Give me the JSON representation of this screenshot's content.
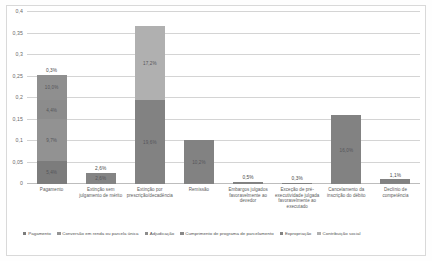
{
  "chart_data": {
    "type": "bar",
    "subtype": "stacked-bar",
    "title": "",
    "xlabel": "",
    "ylabel": "",
    "ylim": [
      0,
      0.4
    ],
    "grid": true,
    "legend_position": "bottom",
    "y_ticks": [
      0,
      0.05,
      0.1,
      0.15,
      0.2,
      0.25,
      0.3,
      0.35,
      0.4
    ],
    "y_tick_labels": [
      "0",
      "0,05",
      "0,1",
      "0,15",
      "0,2",
      "0,25",
      "0,3",
      "0,35",
      "0,4"
    ],
    "categories": [
      "Pagamento",
      "Extinção sem julgamento de mérito",
      "Extinção por prescrição/decadência",
      "Remissão",
      "Embargos julgados favoravelmente ao devedor",
      "Exceção de pré-executividade julgada favoravelmente ao executado",
      "Cancelamento da inscrição do débito",
      "Declínio de competência"
    ],
    "series": [
      {
        "name": "Pagamento",
        "color": "#7f7f7f",
        "values": [
          0.054,
          0.0,
          0.0,
          0.0,
          0.0,
          0.0,
          0.0,
          0.0
        ]
      },
      {
        "name": "Conversão em renda ou parcela única",
        "color": "#9a9a9a",
        "values": [
          0.047,
          0.0,
          0.0,
          0.0,
          0.0,
          0.0,
          0.0,
          0.0
        ]
      },
      {
        "name": "Adjudicação",
        "color": "#8f8f8f",
        "values": [
          0.044,
          0.0,
          0.0,
          0.0,
          0.0,
          0.0,
          0.0,
          0.0
        ]
      },
      {
        "name": "Cumprimento de programa de parcelamento",
        "color": "#8a8a8a",
        "values": [
          0.109,
          0.0,
          0.0,
          0.0,
          0.0,
          0.0,
          0.0,
          0.0
        ]
      },
      {
        "name": "Expropriação",
        "color": "#858585",
        "values": [
          0.0,
          0.026,
          0.196,
          0.102,
          0.005,
          0.003,
          0.16,
          0.011
        ]
      },
      {
        "name": "Contribuição social",
        "color": "#b3b3b3",
        "values": [
          0.0,
          0.0,
          0.172,
          0.0,
          0.0,
          0.0,
          0.0,
          0.0
        ]
      }
    ],
    "bars": [
      {
        "category": "Pagamento",
        "total": 0.254,
        "total_label": "0,3%",
        "segments": [
          {
            "label": "5,4%",
            "value": 0.054,
            "color": "#7c7c7c"
          },
          {
            "label": "9,7%",
            "value": 0.097,
            "color": "#929292"
          },
          {
            "label": "4,4%",
            "value": 0.044,
            "color": "#8c8c8c"
          },
          {
            "label": "10,0%",
            "value": 0.059,
            "color": "#8f8f8f"
          }
        ]
      },
      {
        "category": "Extinção sem julgamento de mérito",
        "total": 0.026,
        "total_label": "2,6%",
        "segments": [
          {
            "label": "2,6%",
            "value": 0.026,
            "color": "#848484"
          }
        ]
      },
      {
        "category": "Extinção por prescrição/decadência",
        "total": 0.368,
        "total_label": "",
        "segments": [
          {
            "label": "19,6%",
            "value": 0.196,
            "color": "#828282"
          },
          {
            "label": "17,2%",
            "value": 0.172,
            "color": "#b0b0b0"
          }
        ]
      },
      {
        "category": "Remissão",
        "total": 0.102,
        "total_label": "",
        "segments": [
          {
            "label": "10,2%",
            "value": 0.102,
            "color": "#828282"
          }
        ]
      },
      {
        "category": "Embargos julgados favoravelmente ao devedor",
        "total": 0.005,
        "total_label": "0,5%",
        "segments": [
          {
            "label": "",
            "value": 0.005,
            "color": "#828282"
          }
        ]
      },
      {
        "category": "Exceção de pré-executividade julgada favoravelmente ao executado",
        "total": 0.003,
        "total_label": "0,3%",
        "segments": [
          {
            "label": "",
            "value": 0.003,
            "color": "#828282"
          }
        ]
      },
      {
        "category": "Cancelamento da inscrição do débito",
        "total": 0.16,
        "total_label": "",
        "segments": [
          {
            "label": "16,0%",
            "value": 0.16,
            "color": "#828282"
          }
        ]
      },
      {
        "category": "Declínio de competência",
        "total": 0.011,
        "total_label": "1,1%",
        "segments": [
          {
            "label": "",
            "value": 0.011,
            "color": "#828282"
          }
        ]
      }
    ],
    "legend": [
      {
        "label": "Pagamento",
        "color": "#7c7c7c"
      },
      {
        "label": "Conversão em renda ou parcela única",
        "color": "#949494"
      },
      {
        "label": "Adjudicação",
        "color": "#8c8c8c"
      },
      {
        "label": "Cumprimento de programa de parcelamento",
        "color": "#888888"
      },
      {
        "label": "Expropriação",
        "color": "#828282"
      },
      {
        "label": "Contribuição social",
        "color": "#b0b0b0"
      }
    ]
  }
}
